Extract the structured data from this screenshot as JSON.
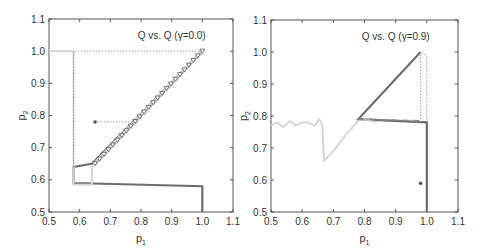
{
  "chart_data": [
    {
      "type": "line",
      "title": "Q vs. Q (γ=0.0)",
      "xlabel": "p1",
      "ylabel": "p2",
      "xlim": [
        0.5,
        1.1
      ],
      "ylim": [
        0.5,
        1.1
      ],
      "xticks": [
        "0.5",
        "0.6",
        "0.7",
        "0.8",
        "0.9",
        "1.0",
        "1.1"
      ],
      "yticks": [
        "0.5",
        "0.6",
        "0.7",
        "0.8",
        "0.9",
        "1.0",
        "1.1"
      ],
      "grid": false,
      "series": [
        {
          "name": "trajectory-dark",
          "style": "solid dark gray",
          "x": [
            1.0,
            1.0,
            0.58,
            0.58,
            0.64,
            1.0
          ],
          "y": [
            0.5,
            0.58,
            0.59,
            0.64,
            0.65,
            1.0
          ]
        },
        {
          "name": "trajectory-triangles",
          "style": "triangle markers",
          "x": [
            0.65,
            1.0
          ],
          "y": [
            0.65,
            1.0
          ]
        },
        {
          "name": "trajectory-light",
          "style": "solid light gray",
          "x": [
            0.5,
            0.58,
            0.58,
            0.64,
            0.64
          ],
          "y": [
            1.0,
            1.0,
            0.585,
            0.585,
            0.645
          ]
        },
        {
          "name": "dotted-guide",
          "style": "dotted",
          "x": [
            0.58,
            0.58,
            1.0
          ],
          "y": [
            0.64,
            1.0,
            1.0
          ]
        },
        {
          "name": "start-point",
          "style": "dot + dotted",
          "x": [
            0.65,
            0.78
          ],
          "y": [
            0.78,
            0.78
          ]
        }
      ]
    },
    {
      "type": "line",
      "title": "Q vs. Q (γ=0.9)",
      "xlabel": "p1",
      "ylabel": "p2",
      "xlim": [
        0.5,
        1.1
      ],
      "ylim": [
        0.5,
        1.1
      ],
      "xticks": [
        "0.5",
        "0.6",
        "0.7",
        "0.8",
        "0.9",
        "1.0",
        "1.1"
      ],
      "yticks": [
        "0.5",
        "0.6",
        "0.7",
        "0.8",
        "0.9",
        "1.0",
        "1.1"
      ],
      "grid": false,
      "series": [
        {
          "name": "trajectory-dark",
          "style": "solid dark gray",
          "x": [
            1.0,
            1.0,
            0.78,
            0.98
          ],
          "y": [
            0.5,
            0.78,
            0.79,
            1.0
          ]
        },
        {
          "name": "trajectory-light-noisy",
          "style": "solid light gray",
          "x": [
            0.5,
            0.52,
            0.54,
            0.56,
            0.58,
            0.6,
            0.62,
            0.64,
            0.655,
            0.665,
            0.67,
            0.7,
            0.74,
            0.78,
            0.8,
            0.84
          ],
          "y": [
            0.77,
            0.78,
            0.765,
            0.785,
            0.77,
            0.78,
            0.78,
            0.77,
            0.79,
            0.77,
            0.66,
            0.69,
            0.74,
            0.785,
            0.79,
            0.78
          ]
        },
        {
          "name": "dash-dot",
          "style": "dash-dot",
          "x": [
            0.78,
            0.98
          ],
          "y": [
            0.79,
            0.785
          ]
        },
        {
          "name": "dotted-guides",
          "style": "dotted",
          "x": [
            0.98,
            0.98,
            1.0,
            1.0
          ],
          "y": [
            0.78,
            1.0,
            0.99,
            0.78
          ]
        },
        {
          "name": "end-point",
          "style": "dot",
          "x": [
            0.98
          ],
          "y": [
            0.59
          ]
        }
      ]
    }
  ],
  "plots": [
    {
      "title": "Q vs. Q (γ=0.0)",
      "xlabel": "p",
      "xsub": "1",
      "ylabel": "p",
      "ysub": "2"
    },
    {
      "title": "Q vs. Q (γ=0.9)",
      "xlabel": "p",
      "xsub": "1",
      "ylabel": "p",
      "ysub": "2"
    }
  ],
  "ticks": [
    "0.5",
    "0.6",
    "0.7",
    "0.8",
    "0.9",
    "1.0",
    "1.1"
  ]
}
